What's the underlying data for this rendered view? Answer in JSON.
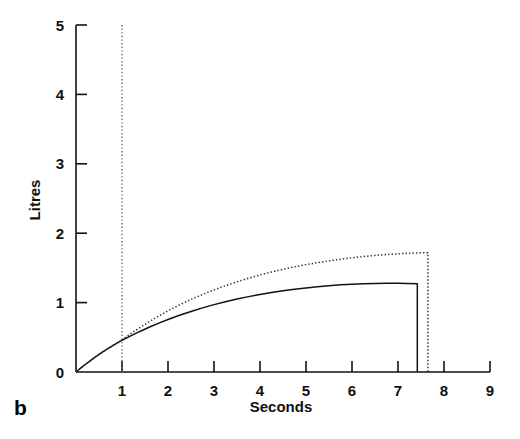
{
  "figure": {
    "panel_label": "b"
  },
  "chart_data": {
    "type": "line",
    "title": "",
    "xlabel": "Seconds",
    "ylabel": "Litres",
    "xlim": [
      0,
      9
    ],
    "ylim": [
      0,
      5
    ],
    "grid": false,
    "legend": "none",
    "x_ticks": [
      1,
      2,
      3,
      4,
      5,
      6,
      7,
      8,
      9
    ],
    "x_tick_labels": [
      "1",
      "2",
      "3",
      "4",
      "5",
      "6",
      "7",
      "8",
      "9"
    ],
    "y_ticks": [
      0,
      1,
      2,
      3,
      4,
      5
    ],
    "y_tick_labels": [
      "0",
      "1",
      "2",
      "3",
      "4",
      "5"
    ],
    "annotations": [
      {
        "name": "inspiratory-time-marker",
        "type": "vline",
        "x": 1,
        "y_from": 0,
        "y_to": 5,
        "style": "dotted"
      }
    ],
    "series": [
      {
        "name": "solid-curve",
        "style": "solid",
        "color": "#111111",
        "plateau_value": 1.28,
        "end_x": 7.42,
        "x": [
          0,
          0.1,
          0.2,
          0.3,
          0.4,
          0.5,
          0.6,
          0.7,
          0.8,
          0.9,
          1.0,
          1.2,
          1.4,
          1.6,
          1.8,
          2.0,
          2.25,
          2.5,
          2.75,
          3.0,
          3.25,
          3.5,
          3.75,
          4.0,
          4.25,
          4.5,
          4.75,
          5.0,
          5.25,
          5.5,
          5.75,
          6.0,
          6.25,
          6.5,
          6.75,
          7.0,
          7.2,
          7.42,
          7.42
        ],
        "y": [
          0,
          0.055,
          0.108,
          0.158,
          0.207,
          0.253,
          0.298,
          0.34,
          0.381,
          0.42,
          0.458,
          0.524,
          0.588,
          0.648,
          0.704,
          0.757,
          0.818,
          0.873,
          0.924,
          0.971,
          1.013,
          1.051,
          1.086,
          1.117,
          1.145,
          1.17,
          1.193,
          1.212,
          1.229,
          1.244,
          1.256,
          1.266,
          1.273,
          1.277,
          1.279,
          1.278,
          1.276,
          1.273,
          0
        ]
      },
      {
        "name": "dotted-curve",
        "style": "dotted",
        "color": "#333333",
        "plateau_value": 1.72,
        "end_x": 7.65,
        "x": [
          0,
          0.1,
          0.2,
          0.3,
          0.4,
          0.5,
          0.6,
          0.7,
          0.8,
          0.9,
          1.0,
          1.2,
          1.4,
          1.6,
          1.8,
          2.0,
          2.25,
          2.5,
          2.75,
          3.0,
          3.25,
          3.5,
          3.75,
          4.0,
          4.25,
          4.5,
          4.75,
          5.0,
          5.25,
          5.5,
          5.75,
          6.0,
          6.25,
          6.5,
          6.75,
          7.0,
          7.25,
          7.5,
          7.65,
          7.65
        ],
        "y": [
          0,
          0.055,
          0.108,
          0.158,
          0.207,
          0.253,
          0.298,
          0.34,
          0.381,
          0.42,
          0.462,
          0.556,
          0.645,
          0.729,
          0.808,
          0.882,
          0.967,
          1.045,
          1.117,
          1.183,
          1.244,
          1.3,
          1.351,
          1.398,
          1.441,
          1.48,
          1.515,
          1.547,
          1.576,
          1.602,
          1.625,
          1.646,
          1.664,
          1.68,
          1.693,
          1.703,
          1.712,
          1.718,
          1.72,
          0
        ]
      }
    ]
  }
}
